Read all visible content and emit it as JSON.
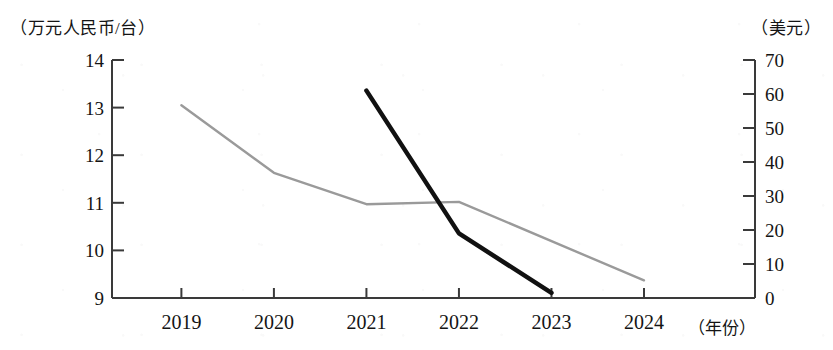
{
  "chart_data": {
    "type": "line",
    "title": "",
    "xlabel": "（年份）",
    "categories": [
      "2019",
      "2020",
      "2021",
      "2022",
      "2023",
      "2024"
    ],
    "grid": false,
    "legend_position": "none",
    "axes": {
      "left": {
        "unit_label": "（万元人民币/台）",
        "ticks": [
          "14",
          "13",
          "12",
          "11",
          "10",
          "9"
        ],
        "tick_values": [
          14,
          13,
          12,
          11,
          10,
          9
        ],
        "ylim": [
          9,
          14
        ]
      },
      "right": {
        "unit_label": "（美元）",
        "ticks": [
          "70",
          "60",
          "50",
          "40",
          "30",
          "20",
          "10",
          "0"
        ],
        "tick_values": [
          70,
          60,
          50,
          40,
          30,
          20,
          10,
          0
        ],
        "ylim": [
          0,
          70
        ]
      }
    },
    "series": [
      {
        "name": "万元人民币/台",
        "axis": "left",
        "color": "#9a9a9a",
        "x": [
          "2019",
          "2020",
          "2021",
          "2022",
          "2024"
        ],
        "values": [
          13.05,
          11.63,
          10.97,
          11.02,
          9.37
        ]
      },
      {
        "name": "美元",
        "axis": "right",
        "color": "#111111",
        "x": [
          "2021",
          "2022",
          "2023"
        ],
        "values": [
          61,
          19,
          1.5
        ]
      }
    ]
  }
}
